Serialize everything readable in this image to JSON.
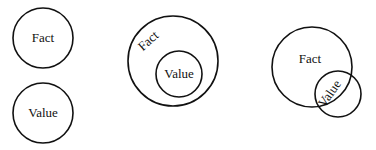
{
  "diagram": {
    "panels": [
      {
        "id": "separate",
        "description": "Fact and Value as disjoint circles",
        "circles": [
          {
            "label": "Fact",
            "cx": 43,
            "cy": 38,
            "r": 30
          },
          {
            "label": "Value",
            "cx": 43,
            "cy": 113,
            "r": 30
          }
        ]
      },
      {
        "id": "nested",
        "description": "Value circle contained inside Fact circle",
        "circles": [
          {
            "label": "Fact",
            "cx": 173,
            "cy": 61,
            "r": 45
          },
          {
            "label": "Value",
            "cx": 179,
            "cy": 74,
            "r": 23
          }
        ]
      },
      {
        "id": "overlapping",
        "description": "Fact and Value circles partially overlapping",
        "circles": [
          {
            "label": "Fact",
            "cx": 312,
            "cy": 67,
            "r": 40
          },
          {
            "label": "Value",
            "cx": 338,
            "cy": 94,
            "r": 23
          }
        ]
      }
    ],
    "labels": {
      "p1_fact": "Fact",
      "p1_value": "Value",
      "p2_fact": "Fact",
      "p2_value": "Value",
      "p3_fact": "Fact",
      "p3_value": "Value"
    },
    "colors": {
      "stroke": "#111111",
      "background": "#ffffff"
    }
  }
}
